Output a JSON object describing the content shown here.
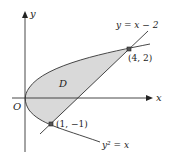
{
  "figure": {
    "type": "region-between-curves",
    "axes": {
      "x_label": "x",
      "y_label": "y",
      "origin_label": "O"
    },
    "curves": [
      {
        "name": "line",
        "label": "y = x − 2"
      },
      {
        "name": "parabola",
        "label": "y² = x"
      }
    ],
    "region": {
      "label": "D",
      "fill": "#d9d9d9"
    },
    "points": [
      {
        "label": "(4, 2)",
        "x": 4,
        "y": 2
      },
      {
        "label": "(1, −1)",
        "x": 1,
        "y": -1
      }
    ],
    "colors": {
      "stroke": "#333333",
      "region_fill": "#d9d9d9",
      "background": "#ffffff"
    }
  }
}
